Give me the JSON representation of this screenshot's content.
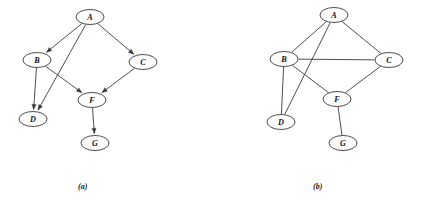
{
  "figure": {
    "width": 421,
    "height": 202,
    "background_color": "#ffffff",
    "edge_color": "#3a3a3a",
    "node_fill_color": "#ffffff",
    "node_stroke_color": "#2e2e2e",
    "label_color": "#111111"
  },
  "panels": [
    {
      "id": "a",
      "caption": "(a)",
      "graph_type": "directed",
      "nodes": [
        {
          "id": "A",
          "label": "A",
          "cx": 90,
          "cy": 17,
          "rx": 14,
          "ry": 7.5
        },
        {
          "id": "B",
          "label": "B",
          "cx": 37,
          "cy": 60,
          "rx": 14,
          "ry": 7.5
        },
        {
          "id": "C",
          "label": "C",
          "cx": 143,
          "cy": 62,
          "rx": 14,
          "ry": 7.5
        },
        {
          "id": "D",
          "label": "D",
          "cx": 33,
          "cy": 119,
          "rx": 14,
          "ry": 7.5
        },
        {
          "id": "F",
          "label": "F",
          "cx": 92,
          "cy": 100,
          "rx": 14,
          "ry": 7.5
        },
        {
          "id": "G",
          "label": "G",
          "cx": 95,
          "cy": 143,
          "rx": 14,
          "ry": 7.5
        }
      ],
      "edges": [
        {
          "from": "A",
          "to": "B",
          "directed": true
        },
        {
          "from": "A",
          "to": "C",
          "directed": true
        },
        {
          "from": "A",
          "to": "D",
          "directed": true
        },
        {
          "from": "B",
          "to": "D",
          "directed": true
        },
        {
          "from": "B",
          "to": "F",
          "directed": true
        },
        {
          "from": "C",
          "to": "F",
          "directed": true
        },
        {
          "from": "F",
          "to": "G",
          "directed": true
        }
      ]
    },
    {
      "id": "b",
      "caption": "(b)",
      "graph_type": "undirected",
      "nodes": [
        {
          "id": "A",
          "label": "A",
          "cx": 124,
          "cy": 15,
          "rx": 14,
          "ry": 7.5
        },
        {
          "id": "B",
          "label": "B",
          "cx": 74,
          "cy": 59,
          "rx": 14,
          "ry": 7.5
        },
        {
          "id": "C",
          "label": "C",
          "cx": 179,
          "cy": 60,
          "rx": 14,
          "ry": 7.5
        },
        {
          "id": "D",
          "label": "D",
          "cx": 71,
          "cy": 122,
          "rx": 14,
          "ry": 7.5
        },
        {
          "id": "F",
          "label": "F",
          "cx": 127,
          "cy": 99,
          "rx": 14,
          "ry": 7.5
        },
        {
          "id": "G",
          "label": "G",
          "cx": 133,
          "cy": 143,
          "rx": 14,
          "ry": 7.5
        }
      ],
      "edges": [
        {
          "from": "A",
          "to": "B",
          "directed": false
        },
        {
          "from": "A",
          "to": "C",
          "directed": false
        },
        {
          "from": "A",
          "to": "D",
          "directed": false
        },
        {
          "from": "B",
          "to": "C",
          "directed": false
        },
        {
          "from": "B",
          "to": "D",
          "directed": false
        },
        {
          "from": "B",
          "to": "F",
          "directed": false
        },
        {
          "from": "C",
          "to": "F",
          "directed": false
        },
        {
          "from": "F",
          "to": "G",
          "directed": false
        }
      ]
    }
  ]
}
